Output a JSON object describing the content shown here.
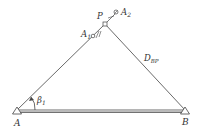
{
  "diagram": {
    "points": {
      "A": {
        "label": "A"
      },
      "B": {
        "label": "B"
      },
      "P": {
        "label": "P"
      },
      "A1": {
        "label": "A",
        "sub": "1"
      },
      "A2": {
        "label": "A",
        "sub": "2"
      }
    },
    "distance_label": {
      "main": "D",
      "sub": "BP"
    },
    "angle_label": {
      "main": "β",
      "sub": "1"
    },
    "colors": {
      "line": "#444444",
      "baseline_fill": "#bbbbbb",
      "text": "#333333"
    }
  }
}
